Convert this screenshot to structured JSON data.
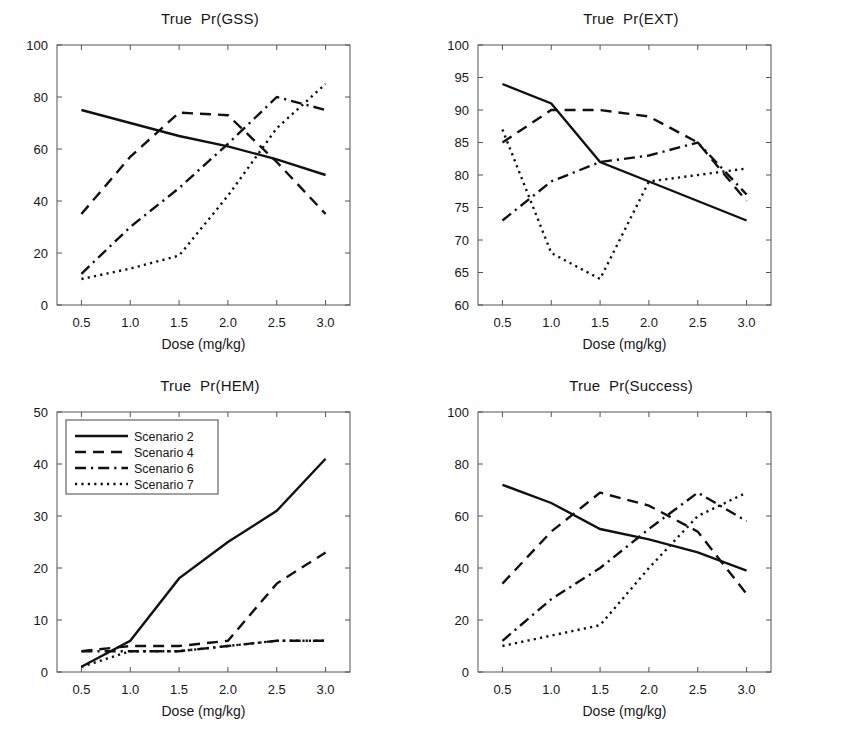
{
  "figure": {
    "background": "#ffffff",
    "line_color": "#111111",
    "axis_color": "#555555",
    "text_color": "#161616"
  },
  "axis": {
    "xlabel": "Dose  (mg/kg)",
    "xticks": [
      "0.5",
      "1.0",
      "1.5",
      "2.0",
      "2.5",
      "3.0"
    ]
  },
  "legend": {
    "position": "top-left of Pr(HEM) panel",
    "entries": [
      {
        "label": "Scenario 2",
        "style": "solid"
      },
      {
        "label": "Scenario 4",
        "style": "dashed"
      },
      {
        "label": "Scenario 6",
        "style": "dashdot"
      },
      {
        "label": "Scenario 7",
        "style": "dotted"
      }
    ]
  },
  "titles": {
    "gss": "True  Pr(GSS)",
    "ext": "True  Pr(EXT)",
    "hem": "True  Pr(HEM)",
    "success": "True  Pr(Success)"
  },
  "chart_data": [
    {
      "id": "gss",
      "type": "line",
      "title": "True  Pr(GSS)",
      "xlabel": "Dose  (mg/kg)",
      "ylabel": "",
      "x": [
        0.5,
        1.0,
        1.5,
        2.0,
        2.5,
        3.0
      ],
      "xlim": [
        0.25,
        3.25
      ],
      "ylim": [
        0,
        100
      ],
      "yticks": [
        0,
        20,
        40,
        60,
        80,
        100
      ],
      "xticks": [
        0.5,
        1.0,
        1.5,
        2.0,
        2.5,
        3.0
      ],
      "grid": false,
      "legend": "none",
      "series": [
        {
          "name": "Scenario 2",
          "style": "solid",
          "values": [
            75,
            70,
            65,
            61,
            56,
            50
          ]
        },
        {
          "name": "Scenario 4",
          "style": "dashed",
          "values": [
            35,
            57,
            74,
            73,
            55,
            35
          ]
        },
        {
          "name": "Scenario 6",
          "style": "dashdot",
          "values": [
            12,
            30,
            45,
            62,
            80,
            75
          ]
        },
        {
          "name": "Scenario 7",
          "style": "dotted",
          "values": [
            10,
            14,
            19,
            42,
            68,
            85
          ]
        }
      ]
    },
    {
      "id": "ext",
      "type": "line",
      "title": "True  Pr(EXT)",
      "xlabel": "Dose  (mg/kg)",
      "ylabel": "",
      "x": [
        0.5,
        1.0,
        1.5,
        2.0,
        2.5,
        3.0
      ],
      "xlim": [
        0.25,
        3.25
      ],
      "ylim": [
        60,
        100
      ],
      "yticks": [
        60,
        65,
        70,
        75,
        80,
        85,
        90,
        95,
        100
      ],
      "xticks": [
        0.5,
        1.0,
        1.5,
        2.0,
        2.5,
        3.0
      ],
      "grid": false,
      "legend": "none",
      "series": [
        {
          "name": "Scenario 2",
          "style": "solid",
          "values": [
            94,
            91,
            82,
            79,
            76,
            73
          ]
        },
        {
          "name": "Scenario 4",
          "style": "dashed",
          "values": [
            85,
            90,
            90,
            89,
            85,
            76
          ]
        },
        {
          "name": "Scenario 6",
          "style": "dashdot",
          "values": [
            73,
            79,
            82,
            83,
            85,
            77
          ]
        },
        {
          "name": "Scenario 7",
          "style": "dotted",
          "values": [
            87,
            68,
            64,
            79,
            80,
            81
          ]
        }
      ]
    },
    {
      "id": "hem",
      "type": "line",
      "title": "True  Pr(HEM)",
      "xlabel": "Dose  (mg/kg)",
      "ylabel": "",
      "x": [
        0.5,
        1.0,
        1.5,
        2.0,
        2.5,
        3.0
      ],
      "xlim": [
        0.25,
        3.25
      ],
      "ylim": [
        0,
        50
      ],
      "yticks": [
        0,
        10,
        20,
        30,
        40,
        50
      ],
      "xticks": [
        0.5,
        1.0,
        1.5,
        2.0,
        2.5,
        3.0
      ],
      "grid": false,
      "legend": "upper-left",
      "series": [
        {
          "name": "Scenario 2",
          "style": "solid",
          "values": [
            1,
            6,
            18,
            25,
            31,
            41
          ]
        },
        {
          "name": "Scenario 4",
          "style": "dashed",
          "values": [
            4,
            5,
            5,
            6,
            17,
            23
          ]
        },
        {
          "name": "Scenario 6",
          "style": "dashdot",
          "values": [
            4,
            4,
            4,
            5,
            6,
            6
          ]
        },
        {
          "name": "Scenario 7",
          "style": "dotted",
          "values": [
            1,
            4,
            4,
            5,
            6,
            6
          ]
        }
      ]
    },
    {
      "id": "success",
      "type": "line",
      "title": "True  Pr(Success)",
      "xlabel": "Dose  (mg/kg)",
      "ylabel": "",
      "x": [
        0.5,
        1.0,
        1.5,
        2.0,
        2.5,
        3.0
      ],
      "xlim": [
        0.25,
        3.25
      ],
      "ylim": [
        0,
        100
      ],
      "yticks": [
        0,
        20,
        40,
        60,
        80,
        100
      ],
      "xticks": [
        0.5,
        1.0,
        1.5,
        2.0,
        2.5,
        3.0
      ],
      "grid": false,
      "legend": "none",
      "series": [
        {
          "name": "Scenario 2",
          "style": "solid",
          "values": [
            72,
            65,
            55,
            51,
            46,
            39
          ]
        },
        {
          "name": "Scenario 4",
          "style": "dashed",
          "values": [
            34,
            54,
            69,
            64,
            54,
            30
          ]
        },
        {
          "name": "Scenario 6",
          "style": "dashdot",
          "values": [
            12,
            28,
            40,
            55,
            69,
            58
          ]
        },
        {
          "name": "Scenario 7",
          "style": "dotted",
          "values": [
            10,
            14,
            18,
            40,
            60,
            69
          ]
        }
      ]
    }
  ]
}
